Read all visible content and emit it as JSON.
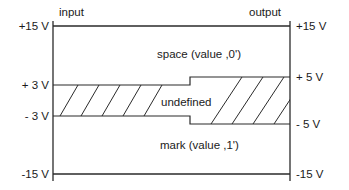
{
  "diagram": {
    "type": "signal-level-diagram",
    "input_label": "input",
    "output_label": "output",
    "left_axis": {
      "top": "+15 V",
      "upper_threshold": "+ 3 V",
      "lower_threshold": "- 3 V",
      "bottom": "-15 V"
    },
    "right_axis": {
      "top": "+15 V",
      "upper_threshold": "+ 5 V",
      "lower_threshold": "- 5 V",
      "bottom": "-15 V"
    },
    "regions": {
      "space": "space (value ,0')",
      "undefined": "undefined",
      "mark": "mark (value ,1')"
    },
    "colors": {
      "line": "#2a2a2a",
      "text": "#1a1a1a",
      "background": "#ffffff"
    }
  }
}
